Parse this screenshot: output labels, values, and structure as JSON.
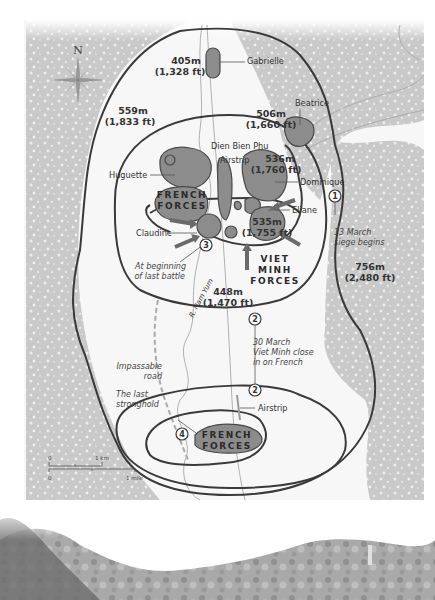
{
  "map": {
    "compass": {
      "label": "N"
    },
    "positions": [
      {
        "name": "Gabrielle"
      },
      {
        "name": "Beatrice"
      },
      {
        "name": "Huguette"
      },
      {
        "name": "Dominique"
      },
      {
        "name": "Eliane"
      },
      {
        "name": "Claudine"
      }
    ],
    "labels": {
      "dien_bien_phu": "Dien Bien Phu",
      "airstrip_north": "Airstrip",
      "airstrip_south": "Airstrip",
      "river": "R. Nam Yum",
      "impassable_road_1": "Impassable",
      "impassable_road_2": "road",
      "last_stronghold_1": "The last",
      "last_stronghold_2": "stronghold"
    },
    "elevations": [
      {
        "m": "405m",
        "ft": "(1,328 ft)"
      },
      {
        "m": "559m",
        "ft": "(1,833 ft)"
      },
      {
        "m": "506m",
        "ft": "(1,660 ft)"
      },
      {
        "m": "536m",
        "ft": "(1,760 ft)"
      },
      {
        "m": "535m",
        "ft": "(1,755 ft)"
      },
      {
        "m": "448m",
        "ft": "(1,470 ft)"
      },
      {
        "m": "756m",
        "ft": "(2,480 ft)"
      }
    ],
    "forces": {
      "french_north": [
        "FRENCH",
        "FORCES"
      ],
      "viet_minh": [
        "VIET",
        "MINH",
        "FORCES"
      ],
      "french_south": [
        "FRENCH",
        "FORCES"
      ]
    },
    "events": [
      {
        "num": "1",
        "line1": "13 March",
        "line2": "siege begins"
      },
      {
        "num": "2",
        "line1": "30 March",
        "line2": "Viet Minh close",
        "line3": "in on French"
      },
      {
        "num": "3",
        "line1": "At beginning",
        "line2": "of last battle"
      },
      {
        "num": "4",
        "line1": "The last",
        "line2": "stronghold"
      }
    ],
    "scale": {
      "km_zero": "0",
      "km_label": "1 km",
      "mi_zero": "0",
      "mi_label": "1 mile"
    }
  },
  "colors": {
    "forest": "#c8c8c8",
    "position_fill": "#8c8c8c",
    "contour": "#3a3a3a",
    "background": "#ffffff"
  }
}
